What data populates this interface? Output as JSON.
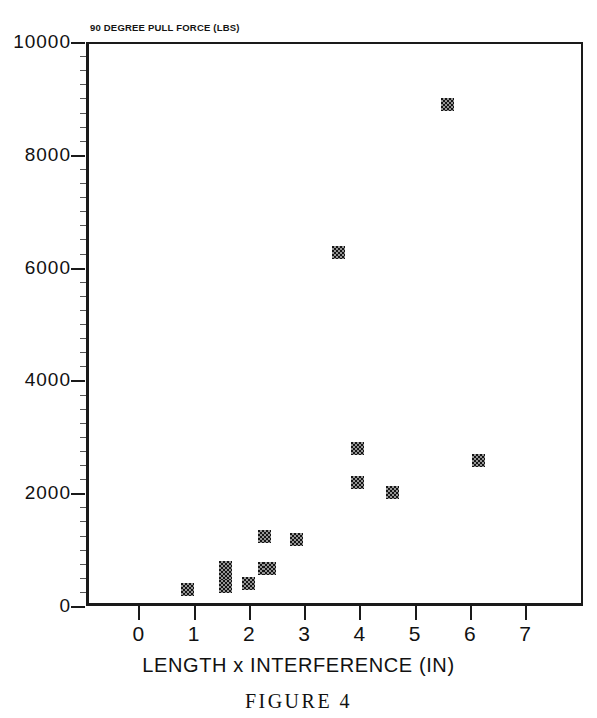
{
  "figure": {
    "caption": "FIGURE 4"
  },
  "chart_data": {
    "type": "scatter",
    "title": "90 DEGREE PULL FORCE (LBS)",
    "xlabel": "LENGTH x INTERFERENCE (IN)",
    "ylabel": "90 DEGREE PULL FORCE (LBS)",
    "xlim": [
      -0.95,
      8.05
    ],
    "ylim": [
      0,
      10000
    ],
    "grid": false,
    "legend": null,
    "xticks": [
      0,
      1,
      2,
      3,
      4,
      5,
      6,
      7
    ],
    "xtick_labels": [
      "0",
      "1",
      "2",
      "3",
      "4",
      "5",
      "6",
      "7"
    ],
    "yticks": [
      0,
      2000,
      4000,
      6000,
      8000,
      10000
    ],
    "ytick_labels": [
      "0",
      "2000",
      "4000",
      "6000",
      "8000",
      "10000"
    ],
    "marker": "filled-square-halftone",
    "marker_color": "#151515",
    "points": [
      {
        "x": 0.84,
        "y": 330
      },
      {
        "x": 1.53,
        "y": 710
      },
      {
        "x": 1.53,
        "y": 580
      },
      {
        "x": 1.53,
        "y": 390
      },
      {
        "x": 1.93,
        "y": 440
      },
      {
        "x": 2.22,
        "y": 1270
      },
      {
        "x": 2.22,
        "y": 700
      },
      {
        "x": 2.32,
        "y": 700
      },
      {
        "x": 2.8,
        "y": 1220
      },
      {
        "x": 3.57,
        "y": 6300
      },
      {
        "x": 3.92,
        "y": 2830
      },
      {
        "x": 3.92,
        "y": 2220
      },
      {
        "x": 4.55,
        "y": 2050
      },
      {
        "x": 5.55,
        "y": 8920
      },
      {
        "x": 6.1,
        "y": 2620
      }
    ]
  }
}
